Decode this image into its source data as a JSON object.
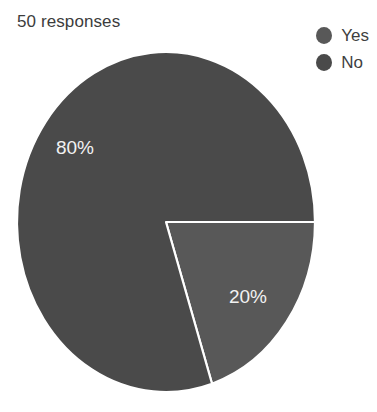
{
  "title": "50 responses",
  "legend": {
    "position": "top-right",
    "items": [
      {
        "label": "Yes",
        "color": "#585858",
        "swatch_name": "legend-swatch-yes"
      },
      {
        "label": "No",
        "color": "#4a4a4a",
        "swatch_name": "legend-swatch-no"
      }
    ]
  },
  "chart_data": {
    "type": "pie",
    "title": "50 responses",
    "xlabel": "",
    "ylabel": "",
    "total_responses": 50,
    "grid": false,
    "legend_position": "top-right",
    "start_angle_deg": 90,
    "direction": "clockwise",
    "categories": [
      "Yes",
      "No"
    ],
    "values": [
      20,
      80
    ],
    "counts": [
      10,
      40
    ],
    "slices": [
      {
        "name": "Yes",
        "percent": 20,
        "count": 10,
        "label": "20%",
        "color": "#585858",
        "start_angle_deg": 90,
        "end_angle_deg": 162
      },
      {
        "name": "No",
        "percent": 80,
        "count": 40,
        "label": "80%",
        "color": "#4a4a4a",
        "start_angle_deg": 162,
        "end_angle_deg": 450
      }
    ],
    "labels": [
      "20%",
      "80%"
    ],
    "label_color": "#f2f2f2",
    "separator_color": "#ffffff",
    "background": "#ffffff"
  },
  "geometry": {
    "center_x": 166,
    "center_y": 222,
    "radius_x": 149,
    "radius_y": 170,
    "label_80_x": 75,
    "label_80_y": 154,
    "label_20_x": 248,
    "label_20_y": 303
  }
}
